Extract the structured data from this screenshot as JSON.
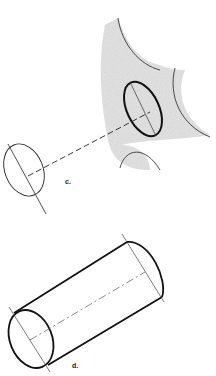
{
  "figures": [
    {
      "id": "c",
      "label": "c.",
      "description": "Ellipse projected onto a shaded curved surface with dash-dot axis"
    },
    {
      "id": "d",
      "label": "d.",
      "description": "Cylinder with elliptical ends and dash-dot center axis"
    }
  ],
  "colors": {
    "line": "#1a1a1a",
    "thin": "#444444",
    "shade": "#d9d9d9",
    "background": "#ffffff"
  }
}
